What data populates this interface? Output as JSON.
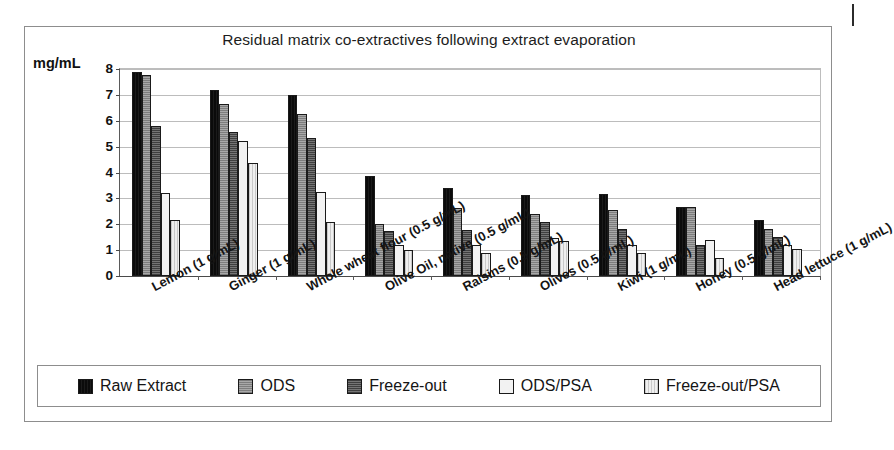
{
  "chart_data": {
    "type": "bar",
    "title": "Residual matrix co-extractives following extract evaporation",
    "xlabel": "",
    "ylabel": "mg/mL",
    "ylim": [
      0,
      8
    ],
    "yticks": [
      0,
      1,
      2,
      3,
      4,
      5,
      6,
      7,
      8
    ],
    "grid": true,
    "legend_position": "bottom",
    "categories": [
      "Lemon (1 g/mL)",
      "Ginger (1 g/mL)",
      "Whole wheat flour (0.5 g/mL)",
      "Olive Oil, native (0.5 g/mL)",
      "Raisins (0.5 g/mL)",
      "Olives (0.5 g/mL)",
      "Kiwi (1 g/mL)",
      "Honey (0.5 g/mL)",
      "Head lettuce (1 g/mL)"
    ],
    "series": [
      {
        "name": "Raw Extract",
        "color": "#0d0d0d",
        "values": [
          7.9,
          7.2,
          7.0,
          3.85,
          3.42,
          3.15,
          3.17,
          2.65,
          2.18
        ]
      },
      {
        "name": "ODS",
        "color": "#989898",
        "values": [
          7.75,
          6.63,
          6.28,
          2.0,
          2.62,
          2.38,
          2.57,
          2.65,
          1.8
        ]
      },
      {
        "name": "Freeze-out",
        "color": "#606060",
        "values": [
          5.78,
          5.57,
          5.32,
          1.75,
          1.78,
          2.08,
          1.8,
          1.2,
          1.5
        ]
      },
      {
        "name": "ODS/PSA",
        "color": "#f2f2f2",
        "values": [
          3.2,
          5.22,
          3.25,
          1.2,
          1.2,
          1.48,
          1.18,
          1.4,
          1.18
        ]
      },
      {
        "name": "Freeze-out/PSA",
        "color": "#e4e4e4",
        "values": [
          2.15,
          4.35,
          2.08,
          1.0,
          0.88,
          1.36,
          0.88,
          0.68,
          1.05
        ]
      }
    ]
  },
  "legend": {
    "items": [
      {
        "label": "Raw Extract"
      },
      {
        "label": "ODS"
      },
      {
        "label": "Freeze-out"
      },
      {
        "label": "ODS/PSA"
      },
      {
        "label": "Freeze-out/PSA"
      }
    ]
  }
}
